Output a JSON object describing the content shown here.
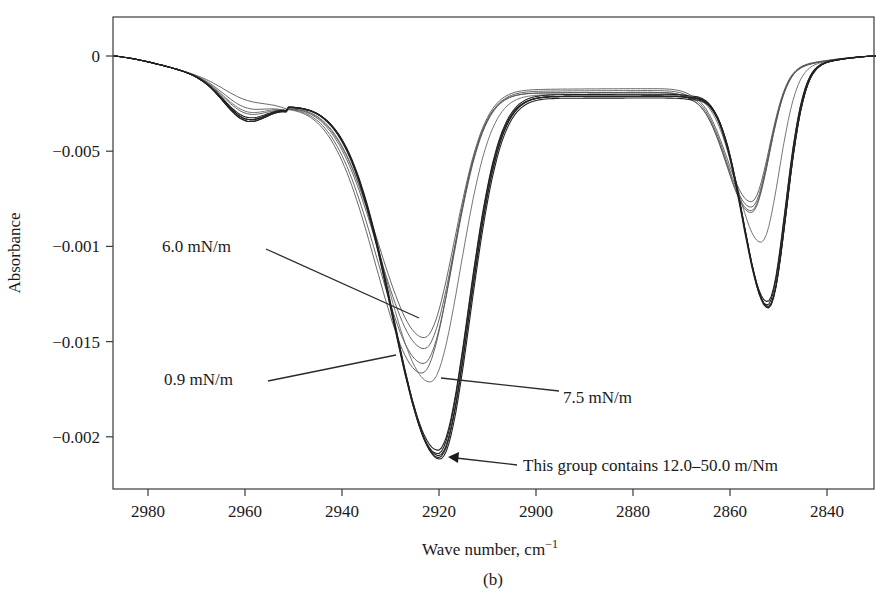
{
  "chart_data": {
    "type": "line",
    "title": "",
    "subtitle": "(b)",
    "xlabel": "Wave number, cm⁻¹",
    "ylabel": "Absorbance",
    "x_reversed": true,
    "xlim": [
      2987,
      2830
    ],
    "ylim": [
      -0.00226,
      0.0002
    ],
    "grid": false,
    "legend": "none (inline annotations)",
    "x_ticks": [
      2980,
      2960,
      2940,
      2920,
      2900,
      2880,
      2860,
      2840
    ],
    "x_tick_labels": [
      "2980",
      "2960",
      "2940",
      "2920",
      "2900",
      "2880",
      "2860",
      "2840"
    ],
    "y_ticks": [
      0,
      -0.0005,
      -0.001,
      -0.0015,
      -0.002
    ],
    "y_tick_labels": [
      "0",
      "−0.005",
      "−0.001",
      "−0.015",
      "−0.002"
    ],
    "annotations": [
      {
        "text": "6.0 mN/m",
        "target_x": 2922,
        "target_y": -0.00145
      },
      {
        "text": "0.9 mN/m",
        "target_x": 2925,
        "target_y": -0.00158
      },
      {
        "text": "7.5 mN/m",
        "target_x": 2920,
        "target_y": -0.00172
      },
      {
        "text": "This group contains 12.0–50.0 m/Nm",
        "target_x": 2919,
        "target_y": -0.0021
      }
    ],
    "series": [
      {
        "name": "0.9 mN/m",
        "group": "low",
        "peak1_x": 2923.5,
        "peak1_min": -0.00165,
        "peak2_x": 2855.5,
        "peak2_min": -0.00085,
        "plateau": -0.00019,
        "dip2960": -0.00031,
        "stroke": "#555555",
        "width": 0.9
      },
      {
        "name": "6.0 mN/m",
        "group": "low",
        "peak1_x": 2923.0,
        "peak1_min": -0.00146,
        "peak2_x": 2855.5,
        "peak2_min": -0.00079,
        "plateau": -0.00017,
        "dip2960": -0.00027,
        "stroke": "#555555",
        "width": 0.9
      },
      {
        "name": "low-3",
        "group": "low",
        "peak1_x": 2923.0,
        "peak1_min": -0.00152,
        "peak2_x": 2855.5,
        "peak2_min": -0.00082,
        "plateau": -0.00018,
        "dip2960": -0.00034,
        "stroke": "#555555",
        "width": 0.9
      },
      {
        "name": "low-4",
        "group": "low",
        "peak1_x": 2923.2,
        "peak1_min": -0.0016,
        "peak2_x": 2855.5,
        "peak2_min": -0.00084,
        "plateau": -0.00019,
        "dip2960": -0.00037,
        "stroke": "#555555",
        "width": 0.9
      },
      {
        "name": "7.5 mN/m",
        "group": "mid",
        "peak1_x": 2921.8,
        "peak1_min": -0.0017,
        "peak2_x": 2853.5,
        "peak2_min": -0.00102,
        "plateau": -0.0002,
        "dip2960": -0.00033,
        "stroke": "#666666",
        "width": 0.9
      },
      {
        "name": "12.0 mN/m",
        "group": "high",
        "peak1_x": 2920.2,
        "peak1_min": -0.00206,
        "peak2_x": 2852.2,
        "peak2_min": -0.00134,
        "plateau": -0.0002,
        "dip2960": -0.00038,
        "stroke": "#222222",
        "width": 1.1
      },
      {
        "name": "20.0 mN/m",
        "group": "high",
        "peak1_x": 2920.2,
        "peak1_min": -0.00208,
        "peak2_x": 2852.2,
        "peak2_min": -0.00136,
        "plateau": -0.00021,
        "dip2960": -0.00037,
        "stroke": "#222222",
        "width": 1.1
      },
      {
        "name": "30.0 mN/m",
        "group": "high",
        "peak1_x": 2920.0,
        "peak1_min": -0.00209,
        "peak2_x": 2852.0,
        "peak2_min": -0.00137,
        "plateau": -0.00021,
        "dip2960": -0.00038,
        "stroke": "#222222",
        "width": 1.1
      },
      {
        "name": "40.0 mN/m",
        "group": "high",
        "peak1_x": 2920.0,
        "peak1_min": -0.0021,
        "peak2_x": 2852.0,
        "peak2_min": -0.00137,
        "plateau": -0.00021,
        "dip2960": -0.00037,
        "stroke": "#222222",
        "width": 1.1
      },
      {
        "name": "50.0 mN/m",
        "group": "high",
        "peak1_x": 2919.8,
        "peak1_min": -0.00211,
        "peak2_x": 2852.0,
        "peak2_min": -0.00138,
        "plateau": -0.00022,
        "dip2960": -0.00036,
        "stroke": "#222222",
        "width": 1.1
      }
    ],
    "key_points": [
      {
        "x": 2987,
        "y": 0.0,
        "note": "all curves start at 0 (left edge)"
      },
      {
        "x": 2960,
        "y": -0.00035,
        "note": "shallow dip"
      },
      {
        "x": 2951,
        "y": -0.00025,
        "note": "local hump"
      },
      {
        "x": 2920,
        "y": -0.0021,
        "note": "CH2 antisymmetric stretch minimum (high-pressure group)"
      },
      {
        "x": 2880,
        "y": -0.00018,
        "note": "plateau between bands"
      },
      {
        "x": 2852,
        "y": -0.00137,
        "note": "CH2 symmetric stretch minimum (high-pressure group)"
      },
      {
        "x": 2830,
        "y": 0.0,
        "note": "return to 0 (right edge)"
      }
    ]
  },
  "labels": {
    "y_axis_title": "Absorbance",
    "x_axis_title_main": "Wave number, cm",
    "x_axis_title_sup": "−1",
    "panel": "(b)",
    "annot_6": "6.0 mN/m",
    "annot_09": "0.9 mN/m",
    "annot_75": "7.5 mN/m",
    "annot_group": "This group contains 12.0–50.0 m/Nm"
  },
  "layout": {
    "plot_px": {
      "left": 113,
      "top": 17,
      "right": 874,
      "bottom": 489
    },
    "x_calib": {
      "ref_value": 2980,
      "ref_px": 148,
      "px_per_unit": 4.85
    },
    "y_calib": {
      "zero_px": 56,
      "px_per_0005": 95.2
    }
  }
}
